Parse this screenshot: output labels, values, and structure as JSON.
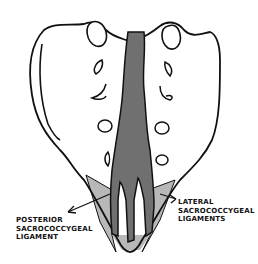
{
  "diagram": {
    "colors": {
      "outline": "#111111",
      "bone_fill": "#ffffff",
      "posterior_ligament": "#707070",
      "lateral_ligaments": "#b8b8b8",
      "background": "#ffffff"
    },
    "labels": {
      "posterior": {
        "lines": [
          "POSTERIOR",
          "SACROCOCCYGEAL",
          "LIGAMENT"
        ]
      },
      "lateral": {
        "lines": [
          "LATERAL",
          "SACROCOCCYGEAL",
          "LIGAMENTS"
        ]
      }
    }
  }
}
